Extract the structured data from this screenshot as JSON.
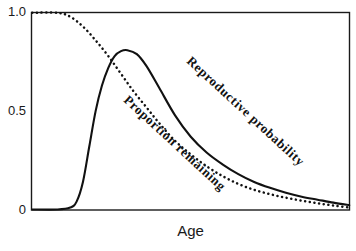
{
  "chart_data": {
    "type": "line",
    "title": "",
    "subtitle": "",
    "xlabel": "Age",
    "ylabel": "",
    "xlim": [
      0,
      100
    ],
    "ylim": [
      0,
      1.0
    ],
    "grid": false,
    "legend_position": "inline-curve-labels",
    "y_ticks": [
      "1.0",
      "0.5",
      "0"
    ],
    "y_tick_values": [
      1.0,
      0.5,
      0
    ],
    "x_ticks": [],
    "annotations": [
      {
        "text": "Reproductive probability",
        "style": "solid-curve-inline-label",
        "rotation_deg": 42
      },
      {
        "text": "Proportion remaining",
        "style": "dotted-curve-inline-label",
        "rotation_deg": 42
      }
    ],
    "series": [
      {
        "name": "Reproductive probability",
        "style": "solid",
        "color": "#111111",
        "x": [
          0,
          8,
          12,
          14,
          16,
          18,
          20,
          22,
          24,
          26,
          28,
          30,
          33,
          36,
          40,
          45,
          50,
          55,
          60,
          65,
          70,
          75,
          80,
          85,
          90,
          95,
          100
        ],
        "y": [
          0.0,
          0.0,
          0.01,
          0.04,
          0.14,
          0.32,
          0.5,
          0.63,
          0.72,
          0.78,
          0.805,
          0.81,
          0.79,
          0.73,
          0.62,
          0.48,
          0.37,
          0.29,
          0.23,
          0.18,
          0.14,
          0.11,
          0.085,
          0.065,
          0.05,
          0.035,
          0.022
        ]
      },
      {
        "name": "Proportion remaining",
        "style": "dotted",
        "color": "#111111",
        "x": [
          0,
          8,
          12,
          16,
          20,
          24,
          28,
          32,
          36,
          40,
          45,
          50,
          55,
          60,
          65,
          70,
          75,
          80,
          85,
          90,
          95,
          100
        ],
        "y": [
          1.0,
          1.0,
          0.98,
          0.93,
          0.86,
          0.78,
          0.69,
          0.6,
          0.52,
          0.44,
          0.35,
          0.28,
          0.22,
          0.17,
          0.13,
          0.1,
          0.078,
          0.06,
          0.045,
          0.032,
          0.02,
          0.01
        ]
      }
    ]
  },
  "axis": {
    "y_tick_1": "1.0",
    "y_tick_05": "0.5",
    "y_tick_0": "0",
    "x_title": "Age"
  },
  "labels": {
    "reproductive_probability": "Reproductive probability",
    "proportion_remaining": "Proportion remaining"
  },
  "colors": {
    "curve": "#111111",
    "frame": "#1a1a1a",
    "background": "#ffffff"
  }
}
